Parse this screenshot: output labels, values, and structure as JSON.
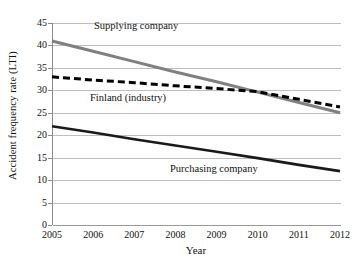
{
  "chart_data": {
    "type": "line",
    "title": "",
    "xlabel": "Year",
    "ylabel": "Accident frequency rate (LTI)",
    "x": [
      2005,
      2006,
      2007,
      2008,
      2009,
      2010,
      2011,
      2012
    ],
    "xtick_labels": [
      "2005",
      "2006",
      "2007",
      "2008",
      "2009",
      "2010",
      "2011",
      "2012"
    ],
    "ytick_labels": [
      "0",
      "5",
      "10",
      "15",
      "20",
      "25",
      "30",
      "35",
      "40",
      "45"
    ],
    "yticks": [
      0,
      5,
      10,
      15,
      20,
      25,
      30,
      35,
      40,
      45
    ],
    "ylim": [
      0,
      45
    ],
    "xlim": [
      2005,
      2012
    ],
    "grid": "horizontal",
    "legend": "inline-annotations",
    "series": [
      {
        "name": "Supplying company",
        "style": "solid",
        "color": "#808080",
        "width": 3.0,
        "values": [
          41,
          38.7,
          36.4,
          34.1,
          31.9,
          29.6,
          27.3,
          25
        ]
      },
      {
        "name": "Finland (industry)",
        "style": "dashed",
        "color": "#000000",
        "width": 3.0,
        "values": [
          33,
          32.3,
          31.7,
          31.0,
          30.4,
          29.7,
          28.0,
          26.3
        ]
      },
      {
        "name": "Purchasing company",
        "style": "solid",
        "color": "#1a1a1a",
        "width": 2.6,
        "values": [
          22,
          20.6,
          19.1,
          17.7,
          16.3,
          14.9,
          13.4,
          12
        ]
      }
    ],
    "annotations": [
      {
        "text": "Supplying company",
        "series": "Supplying company"
      },
      {
        "text": "Finland (industry)",
        "series": "Finland (industry)"
      },
      {
        "text": "Purchasing company",
        "series": "Purchasing company"
      }
    ],
    "colors": {
      "gridline": "#bfbfbf",
      "axis": "#8c8c8c",
      "supplying": "#808080",
      "finland": "#000000",
      "purchasing": "#1a1a1a",
      "background": "#ffffff"
    }
  }
}
